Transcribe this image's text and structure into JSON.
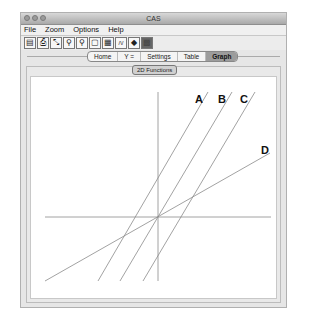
{
  "window": {
    "title": "CAS"
  },
  "menubar": {
    "items": [
      "File",
      "Zoom",
      "Options",
      "Help"
    ]
  },
  "toolbar": {
    "tools": [
      "save-icon",
      "print-icon",
      "edit-icon",
      "zoom-in-icon",
      "zoom-out-icon",
      "zoom-box-icon",
      "calculator-icon",
      "graph-icon",
      "trace-icon",
      "grid-icon"
    ],
    "glyphs": [
      "▤",
      "⎙",
      "⤡",
      "⚲",
      "⚲",
      "▢",
      "▦",
      "/\\/",
      "◆",
      "▩"
    ]
  },
  "tabs": {
    "items": [
      "Home",
      "Y =",
      "Settings",
      "Table",
      "Graph"
    ],
    "active": "Graph"
  },
  "subtab": {
    "label": "2D Functions"
  },
  "chart_data": {
    "type": "line",
    "title": "",
    "xlabel": "",
    "ylabel": "",
    "grid": false,
    "axes": {
      "origin_px": [
        156,
        215
      ]
    },
    "series": [
      {
        "name": "A",
        "description": "steep positive slope, positive y-intercept",
        "slope_relative": 1.72,
        "intercept_sign": "positive"
      },
      {
        "name": "B",
        "description": "steep positive slope, through origin",
        "slope_relative": 1.69,
        "intercept_sign": "zero"
      },
      {
        "name": "C",
        "description": "steep positive slope, negative y-intercept",
        "slope_relative": 1.69,
        "intercept_sign": "negative"
      },
      {
        "name": "D",
        "description": "gentle positive slope, through origin",
        "slope_relative": 0.57,
        "intercept_sign": "zero"
      }
    ],
    "labels": [
      "A",
      "B",
      "C",
      "D"
    ]
  },
  "graph": {
    "lines": [
      {
        "id": "A",
        "x1": 96,
        "y1": 279,
        "x2": 206,
        "y2": 90,
        "lx": 193,
        "ly": 101
      },
      {
        "id": "B",
        "x1": 118,
        "y1": 279,
        "x2": 230,
        "y2": 90,
        "lx": 216,
        "ly": 101
      },
      {
        "id": "C",
        "x1": 141,
        "y1": 279,
        "x2": 253,
        "y2": 90,
        "lx": 238,
        "ly": 101
      },
      {
        "id": "D",
        "x1": 43,
        "y1": 279,
        "x2": 268,
        "y2": 151,
        "lx": 259,
        "ly": 152
      }
    ],
    "colors": {
      "line": "#8a8a8a",
      "axis": "#8a8a8a",
      "label": "#111111"
    }
  }
}
